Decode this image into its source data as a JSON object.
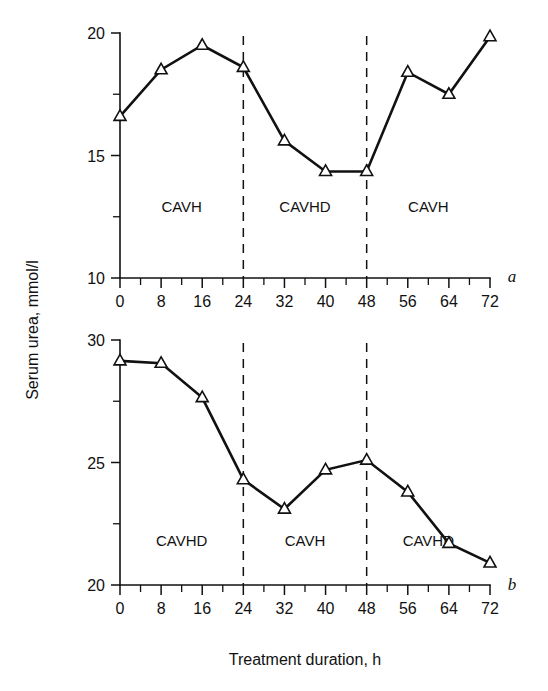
{
  "figure": {
    "y_axis_title": "Serum urea, mmol/l",
    "x_axis_title": "Treatment duration, h"
  },
  "chart_data": [
    {
      "type": "line",
      "panel": "a",
      "panel_label": "a",
      "title": "",
      "xlabel": "Treatment duration, h",
      "ylabel": "Serum urea, mmol/l",
      "xlim": [
        0,
        72
      ],
      "ylim": [
        10,
        20
      ],
      "xticks": [
        0,
        8,
        16,
        24,
        32,
        40,
        48,
        56,
        64,
        72
      ],
      "xtick_labels": [
        "0",
        "8",
        "16",
        "24",
        "32",
        "40",
        "48",
        "56",
        "64",
        "72"
      ],
      "xminor_step": 4,
      "yticks": [
        10,
        15,
        20
      ],
      "ytick_labels": [
        "10",
        "15",
        "20"
      ],
      "yminor": [
        12.5,
        17.5
      ],
      "grid": false,
      "legend": "none",
      "marker": "triangle-up-open",
      "x": [
        0,
        8,
        16,
        24,
        32,
        40,
        48,
        56,
        64,
        72
      ],
      "values": [
        16.6,
        18.5,
        19.5,
        18.6,
        15.6,
        14.35,
        14.35,
        18.4,
        17.5,
        19.85
      ],
      "dividers": [
        24,
        48
      ],
      "regions": [
        {
          "label": "CAVH",
          "x_start": 0,
          "x_end": 24,
          "label_y": 12.7
        },
        {
          "label": "CAVHD",
          "x_start": 24,
          "x_end": 48,
          "label_y": 12.7
        },
        {
          "label": "CAVH",
          "x_start": 48,
          "x_end": 72,
          "label_y": 12.7
        }
      ]
    },
    {
      "type": "line",
      "panel": "b",
      "panel_label": "b",
      "title": "",
      "xlabel": "Treatment duration, h",
      "ylabel": "Serum urea, mmol/l",
      "xlim": [
        0,
        72
      ],
      "ylim": [
        20,
        30
      ],
      "xticks": [
        0,
        8,
        16,
        24,
        32,
        40,
        48,
        56,
        64,
        72
      ],
      "xtick_labels": [
        "0",
        "8",
        "16",
        "24",
        "32",
        "40",
        "48",
        "56",
        "64",
        "72"
      ],
      "xminor_step": 4,
      "yticks": [
        20,
        25,
        30
      ],
      "ytick_labels": [
        "20",
        "25",
        "30"
      ],
      "yminor": [
        22.5,
        27.5
      ],
      "grid": false,
      "legend": "none",
      "marker": "triangle-up-open",
      "x": [
        0,
        8,
        16,
        24,
        32,
        40,
        48,
        56,
        64,
        72
      ],
      "values": [
        29.15,
        29.05,
        27.65,
        24.3,
        23.1,
        24.7,
        25.1,
        23.8,
        21.7,
        20.9
      ],
      "dividers": [
        24,
        48
      ],
      "regions": [
        {
          "label": "CAVHD",
          "x_start": 0,
          "x_end": 24,
          "label_y": 21.6
        },
        {
          "label": "CAVH",
          "x_start": 24,
          "x_end": 48,
          "label_y": 21.6
        },
        {
          "label": "CAVHD",
          "x_start": 48,
          "x_end": 72,
          "label_y": 21.6
        }
      ]
    }
  ]
}
